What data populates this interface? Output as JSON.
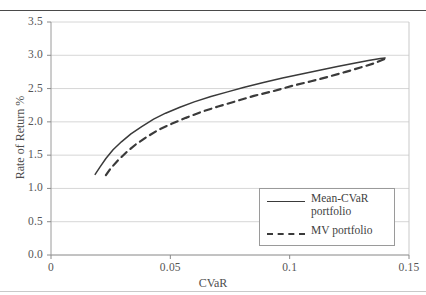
{
  "chart_data": {
    "type": "line",
    "title": "",
    "xlabel": "CVaR",
    "ylabel": "Rate of Return %",
    "xlim": [
      0,
      0.15
    ],
    "ylim": [
      0,
      3.5
    ],
    "xticks": [
      "0",
      "0.05",
      "0.1",
      "0.15"
    ],
    "xtick_values": [
      0,
      0.05,
      0.1,
      0.15
    ],
    "yticks": [
      "0.0",
      "0.5",
      "1.0",
      "1.5",
      "2.0",
      "2.5",
      "3.0",
      "3.5"
    ],
    "ytick_values": [
      0.0,
      0.5,
      1.0,
      1.5,
      2.0,
      2.5,
      3.0,
      3.5
    ],
    "grid": "horizontal",
    "legend_position": "lower right",
    "series": [
      {
        "name": "Mean-CVaR portfolio",
        "style": "solid",
        "color": "#3a3a3a",
        "x": [
          0.0185,
          0.0205,
          0.023,
          0.026,
          0.0295,
          0.0335,
          0.038,
          0.043,
          0.048,
          0.054,
          0.06,
          0.067,
          0.074,
          0.081,
          0.089,
          0.097,
          0.105,
          0.113,
          0.12,
          0.127,
          0.133,
          0.138,
          0.14
        ],
        "y": [
          1.21,
          1.32,
          1.45,
          1.58,
          1.7,
          1.82,
          1.93,
          2.04,
          2.13,
          2.22,
          2.3,
          2.38,
          2.45,
          2.52,
          2.59,
          2.66,
          2.72,
          2.78,
          2.83,
          2.88,
          2.92,
          2.95,
          2.96
        ]
      },
      {
        "name": "MV portfolio",
        "style": "dashed",
        "color": "#3a3a3a",
        "x": [
          0.023,
          0.025,
          0.028,
          0.0315,
          0.0355,
          0.04,
          0.045,
          0.0505,
          0.0565,
          0.063,
          0.07,
          0.0775,
          0.085,
          0.093,
          0.101,
          0.109,
          0.1165,
          0.1235,
          0.13,
          0.1355,
          0.1395,
          0.14
        ],
        "y": [
          1.2,
          1.3,
          1.42,
          1.54,
          1.66,
          1.77,
          1.88,
          1.97,
          2.06,
          2.15,
          2.23,
          2.31,
          2.39,
          2.46,
          2.54,
          2.61,
          2.68,
          2.75,
          2.82,
          2.88,
          2.94,
          2.96
        ]
      }
    ]
  },
  "legend": {
    "items": [
      {
        "label": "Mean-CVaR portfolio",
        "style": "solid"
      },
      {
        "label": "MV portfolio",
        "style": "dashed"
      }
    ]
  }
}
